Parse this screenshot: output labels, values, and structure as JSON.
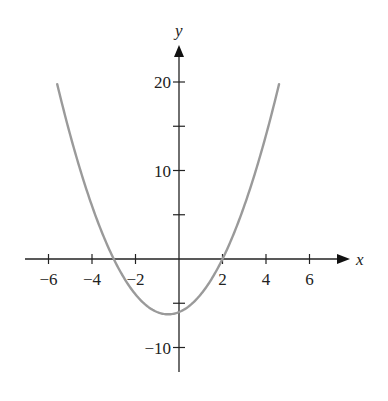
{
  "chart_data": {
    "type": "line",
    "title": "",
    "xlabel": "x",
    "ylabel": "y",
    "function": "y = x^2 + x - 6",
    "xlim": [
      -7,
      7.5
    ],
    "ylim": [
      -13,
      24
    ],
    "x_ticks": [
      -6,
      -4,
      -2,
      2,
      4,
      6
    ],
    "x_tick_labels": [
      "−6",
      "−4",
      "−2",
      "2",
      "4",
      "6"
    ],
    "y_ticks": [
      -10,
      -5,
      5,
      10,
      15,
      20
    ],
    "y_tick_labels": [
      "−10",
      "",
      "",
      "10",
      "",
      "20"
    ],
    "grid": false,
    "legend": null,
    "series": [
      {
        "name": "parabola",
        "color": "#9a9a9a",
        "x": [
          -5.6,
          -5,
          -4,
          -3,
          -2,
          -1,
          -0.5,
          0,
          1,
          2,
          3,
          4,
          4.6
        ],
        "y": [
          19.76,
          14,
          6,
          0,
          -4,
          -6,
          -6.25,
          -6,
          -4,
          0,
          6,
          14,
          19.76
        ]
      }
    ],
    "annotations": {
      "roots": [
        -3,
        2
      ],
      "vertex": [
        -0.5,
        -6.25
      ],
      "y_intercept": -6
    }
  }
}
